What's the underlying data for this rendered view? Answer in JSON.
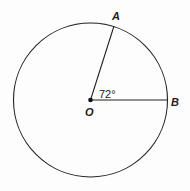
{
  "diagram": {
    "type": "circle-central-angle",
    "center": {
      "label": "O",
      "x": 90.5,
      "y": 100
    },
    "radius": 77,
    "points": [
      {
        "label": "A",
        "x": 114,
        "y": 26
      },
      {
        "label": "B",
        "x": 167.5,
        "y": 100
      }
    ],
    "angle": {
      "vertex": "O",
      "from": "B",
      "to": "A",
      "label": "72°"
    },
    "colors": {
      "stroke": "#222222",
      "background": "#fdfdfd"
    }
  }
}
